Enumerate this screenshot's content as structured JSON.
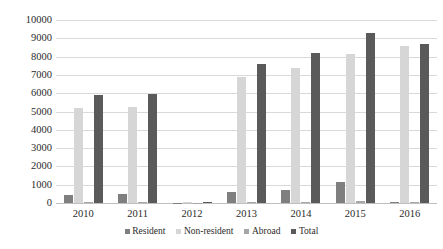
{
  "chart_data": {
    "type": "bar",
    "title": "",
    "xlabel": "",
    "ylabel": "",
    "categories": [
      "2010",
      "2011",
      "2012",
      "2013",
      "2014",
      "2015",
      "2016"
    ],
    "series": [
      {
        "name": "Resident",
        "color": "#7f7f7f",
        "values": [
          450,
          480,
          20,
          600,
          700,
          1150,
          60
        ]
      },
      {
        "name": "Non-resident",
        "color": "#d6d6d6",
        "values": [
          5200,
          5250,
          30,
          6900,
          7400,
          8150,
          8600
        ]
      },
      {
        "name": "Abroad",
        "color": "#a6a6a6",
        "values": [
          70,
          70,
          10,
          80,
          80,
          90,
          80
        ]
      },
      {
        "name": "Total",
        "color": "#5a5a5a",
        "values": [
          5900,
          5950,
          40,
          7600,
          8200,
          9300,
          8700
        ]
      }
    ],
    "ylim": [
      0,
      10000
    ],
    "yticks": [
      "0",
      "1000",
      "2000",
      "3000",
      "4000",
      "5000",
      "6000",
      "7000",
      "8000",
      "9000",
      "10000"
    ],
    "grid": true,
    "legend_position": "bottom"
  }
}
